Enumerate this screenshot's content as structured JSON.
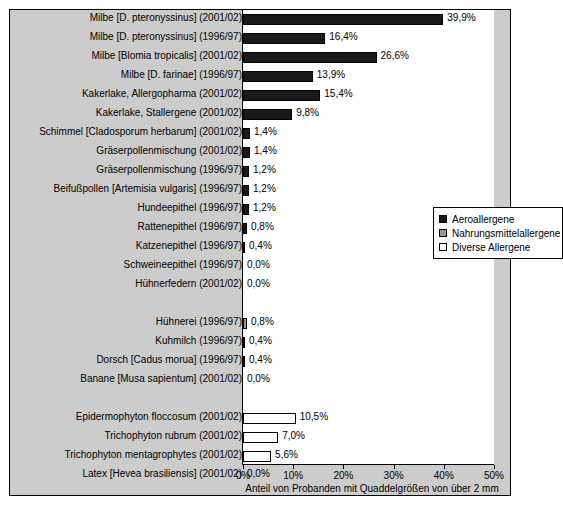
{
  "chart_data": {
    "type": "bar",
    "orientation": "horizontal",
    "title": "",
    "xlabel": "Anteil von Probanden mit Quaddelgrößen von über 2 mm",
    "ylabel": "",
    "xlim": [
      0,
      50
    ],
    "xticks": [
      0,
      10,
      20,
      30,
      40,
      50
    ],
    "xtick_labels": [
      "0%",
      "10%",
      "20%",
      "30%",
      "40%",
      "50%"
    ],
    "grid": false,
    "legend_position": "middle-right",
    "legend": [
      {
        "label": "Aeroallergene",
        "key": "aero",
        "color": "#1a1a1a"
      },
      {
        "label": "Nahrungsmittelallergene",
        "key": "food",
        "color": "#999999"
      },
      {
        "label": "Diverse Allergene",
        "key": "diverse",
        "color": "#ffffff"
      }
    ],
    "categories": [
      "Milbe [D. pteronyssinus] (2001/02)",
      "Milbe [D. pteronyssinus] (1996/97)",
      "Milbe [Blomia tropicalis] (2001/02)",
      "Milbe [D. farinae] (1996/97)",
      "Kakerlake, Allergopharma (2001/02)",
      "Kakerlake, Stallergene (2001/02)",
      "Schimmel [Cladosporum herbarum] (2001/02)",
      "Gräserpollenmischung (2001/02)",
      "Gräserpollenmischung (1996/97)",
      "Beifußpollen [Artemisia vulgaris] (1996/97)",
      "Hundeepithel (1996/97)",
      "Rattenepithel (1996/97)",
      "Katzenepithel (1996/97)",
      "Schweineepithel (1996/97)",
      "Hühnerfedern (2001/02)",
      "",
      "Hühnerei (1996/97)",
      "Kuhmilch (1996/97)",
      "Dorsch [Cadus morua] (1996/97)",
      "Banane [Musa sapientum] (2001/02)",
      "",
      "Epidermophyton floccosum (2001/02)",
      "Trichophyton rubrum (2001/02)",
      "Trichophyton mentagrophytes (2001/02)",
      "Latex [Hevea brasiliensis] (2001/02)"
    ],
    "values": [
      39.9,
      16.4,
      26.6,
      13.9,
      15.4,
      9.8,
      1.4,
      1.4,
      1.2,
      1.2,
      1.2,
      0.8,
      0.4,
      0.0,
      0.0,
      null,
      0.8,
      0.4,
      0.4,
      0.0,
      null,
      10.5,
      7.0,
      5.6,
      0.0
    ],
    "value_labels": [
      "39,9%",
      "16,4%",
      "26,6%",
      "13,9%",
      "15,4%",
      "9,8%",
      "1,4%",
      "1,4%",
      "1,2%",
      "1,2%",
      "1,2%",
      "0,8%",
      "0,4%",
      "0,0%",
      "0,0%",
      "",
      "0,8%",
      "0,4%",
      "0,4%",
      "0,0%",
      "",
      "10,5%",
      "7,0%",
      "5,6%",
      "0,0%"
    ],
    "groups": [
      "aero",
      "aero",
      "aero",
      "aero",
      "aero",
      "aero",
      "aero",
      "aero",
      "aero",
      "aero",
      "aero",
      "aero",
      "aero",
      "aero",
      "aero",
      "none",
      "food",
      "food",
      "food",
      "food",
      "none",
      "diverse",
      "diverse",
      "diverse",
      "diverse"
    ]
  }
}
